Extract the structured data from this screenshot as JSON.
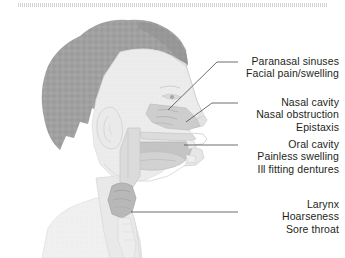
{
  "figure": {
    "background_color": "#ffffff",
    "text_color": "#231f20",
    "leader_line_color": "#4a4a4a",
    "hair_color": "#9a9a9a",
    "skin_color": "#e8e8e8",
    "cavity_color": "#c9c9c9",
    "top_strip_color": "#cfcfcf"
  },
  "labels": [
    {
      "id": "paranasal",
      "lines": [
        "Paranasal sinuses",
        "Facial pain/swelling"
      ]
    },
    {
      "id": "nasal",
      "lines": [
        "Nasal cavity",
        "Nasal obstruction",
        "Epistaxis"
      ]
    },
    {
      "id": "oral",
      "lines": [
        "Oral cavity",
        "Painless swelling",
        "Ill fitting dentures"
      ]
    },
    {
      "id": "larynx",
      "lines": [
        "Larynx",
        "Hoarseness",
        "Sore throat"
      ]
    }
  ],
  "anatomy_regions": [
    {
      "name": "hair"
    },
    {
      "name": "face-profile"
    },
    {
      "name": "ear"
    },
    {
      "name": "nasal-cavity"
    },
    {
      "name": "oral-cavity"
    },
    {
      "name": "tongue"
    },
    {
      "name": "palate"
    },
    {
      "name": "pharynx"
    },
    {
      "name": "larynx"
    },
    {
      "name": "neck"
    },
    {
      "name": "shoulder"
    }
  ]
}
